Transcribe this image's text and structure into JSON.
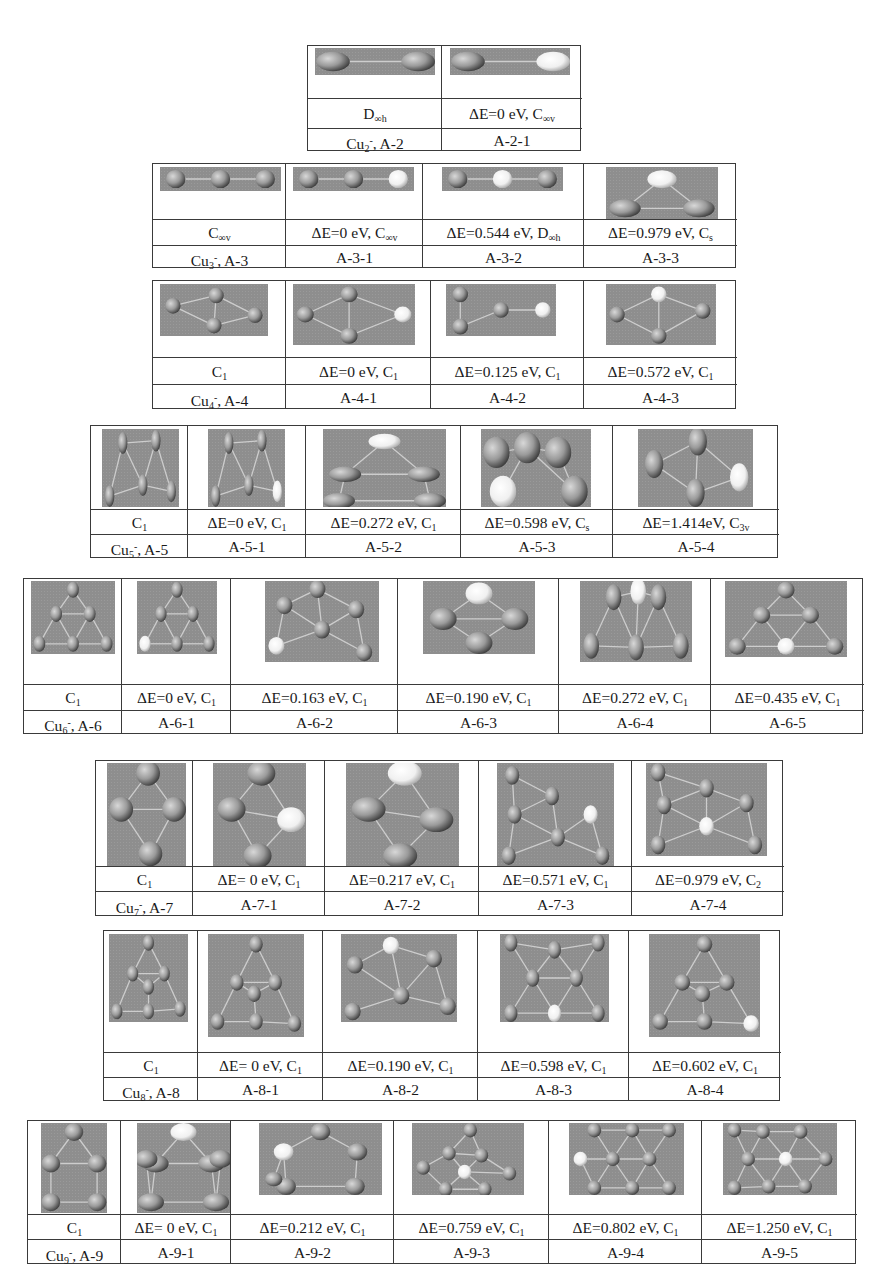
{
  "figure": {
    "tables": [
      {
        "id": "A-2",
        "cells": [
          {
            "sym": "D∞h",
            "sym_main": "D",
            "sym_sub": "∞h",
            "label": "Cu2-, A-2",
            "label_main": "Cu",
            "label_sub": "2",
            "label_sup": "-",
            "label_rest": ", A-2",
            "energy": "",
            "atoms": 2,
            "shape": "dimer-ellipse"
          },
          {
            "sym": "ΔE=0 eV, C∞v",
            "energy_text": "ΔE=0 eV,  C",
            "sym_sub": "∞v",
            "label": "A-2-1",
            "energy": "0",
            "atoms": 2,
            "shape": "dimer-ellipse-light"
          }
        ]
      },
      {
        "id": "A-3",
        "cells": [
          {
            "sym": "C∞v",
            "sym_main": "C",
            "sym_sub": "∞v",
            "label": "Cu3-, A-3",
            "label_main": "Cu",
            "label_sub": "3",
            "label_sup": "-",
            "label_rest": ", A-3",
            "shape": "linear3"
          },
          {
            "sym": "ΔE=0 eV, C∞v",
            "energy_text": "ΔE=0 eV, C",
            "sym_sub": "∞v",
            "label": "A-3-1",
            "energy": "0",
            "shape": "linear3-end-light"
          },
          {
            "sym": "ΔE=0.544 eV, D∞h",
            "energy_text": "ΔE=0.544 eV, D",
            "sym_sub": "∞h",
            "label": "A-3-2",
            "energy": "0.544",
            "shape": "linear3-mid-light"
          },
          {
            "sym": "ΔE=0.979 eV, Cs",
            "energy_text": "ΔE=0.979 eV,  C",
            "sym_sub": "s",
            "label": "A-3-3",
            "energy": "0.979",
            "shape": "triangle"
          }
        ]
      },
      {
        "id": "A-4",
        "cells": [
          {
            "sym": "C1",
            "sym_main": "C",
            "sym_sub": "1",
            "label": "Cu4-, A-4",
            "label_main": "Cu",
            "label_sub": "4",
            "label_sup": "-",
            "label_rest": ", A-4",
            "shape": "rhombus"
          },
          {
            "sym": "ΔE=0 eV, C1",
            "energy_text": "ΔE=0 eV, C",
            "sym_sub": "1",
            "label": "A-4-1",
            "energy": "0",
            "shape": "rhombus-light"
          },
          {
            "sym": "ΔE=0.125 eV, C1",
            "energy_text": "ΔE=0.125 eV, C",
            "sym_sub": "1",
            "label": "A-4-2",
            "energy": "0.125",
            "shape": "chain4"
          },
          {
            "sym": "ΔE=0.572 eV, C1",
            "energy_text": "ΔE=0.572 eV, C",
            "sym_sub": "1",
            "label": "A-4-3",
            "energy": "0.572",
            "shape": "rhombus-top-light"
          }
        ]
      },
      {
        "id": "A-5",
        "cells": [
          {
            "sym": "C1",
            "sym_main": "C",
            "sym_sub": "1",
            "label": "Cu5-, A-5",
            "label_main": "Cu",
            "label_sub": "5",
            "label_sup": "-",
            "label_rest": ", A-5"
          },
          {
            "sym": "ΔE=0 eV, C1",
            "energy_text": "ΔE=0 eV, C",
            "sym_sub": "1",
            "label": "A-5-1",
            "energy": "0"
          },
          {
            "sym": "ΔE=0.272 eV, C1",
            "energy_text": "ΔE=0.272 eV, C",
            "sym_sub": "1",
            "label": "A-5-2",
            "energy": "0.272"
          },
          {
            "sym": "ΔE=0.598 eV, Cs",
            "energy_text": "ΔE=0.598 eV, C",
            "sym_sub": "s",
            "label": "A-5-3",
            "energy": "0.598"
          },
          {
            "sym": "ΔE=1.414eV, C3v",
            "energy_text": "ΔE=1.414eV, C",
            "sym_sub": "3v",
            "label": "A-5-4",
            "energy": "1.414"
          }
        ]
      },
      {
        "id": "A-6",
        "cells": [
          {
            "sym": "C1",
            "sym_main": "C",
            "sym_sub": "1",
            "label": "Cu6-, A-6",
            "label_main": "Cu",
            "label_sub": "6",
            "label_sup": "-",
            "label_rest": ", A-6"
          },
          {
            "sym": "ΔE=0 eV, C1",
            "energy_text": "ΔE=0 eV, C",
            "sym_sub": "1",
            "label": "A-6-1",
            "energy": "0"
          },
          {
            "sym": "ΔE=0.163 eV, C1",
            "energy_text": "ΔE=0.163 eV, C",
            "sym_sub": "1",
            "label": "A-6-2",
            "energy": "0.163"
          },
          {
            "sym": "ΔE=0.190 eV, C1",
            "energy_text": "ΔE=0.190 eV, C",
            "sym_sub": "1",
            "label": "A-6-3",
            "energy": "0.190"
          },
          {
            "sym": "ΔE=0.272 eV, C1",
            "energy_text": "ΔE=0.272 eV, C",
            "sym_sub": "1",
            "label": "A-6-4",
            "energy": "0.272"
          },
          {
            "sym": "ΔE=0.435 eV, C1",
            "energy_text": "ΔE=0.435 eV, C",
            "sym_sub": "1",
            "label": "A-6-5",
            "energy": "0.435"
          }
        ]
      },
      {
        "id": "A-7",
        "cells": [
          {
            "sym": "C1",
            "sym_main": "C",
            "sym_sub": "1",
            "label": "Cu7-, A-7",
            "label_main": "Cu",
            "label_sub": "7",
            "label_sup": "-",
            "label_rest": ", A-7"
          },
          {
            "sym": "ΔE= 0 eV, C1",
            "energy_text": "ΔE= 0 eV, C",
            "sym_sub": "1",
            "label": "A-7-1",
            "energy": "0"
          },
          {
            "sym": "ΔE=0.217 eV, C1",
            "energy_text": "ΔE=0.217 eV, C",
            "sym_sub": "1",
            "label": "A-7-2",
            "energy": "0.217"
          },
          {
            "sym": "ΔE=0.571 eV, C1",
            "energy_text": "ΔE=0.571  eV, C",
            "sym_sub": "1",
            "label": "A-7-3",
            "energy": "0.571"
          },
          {
            "sym": "ΔE=0.979 eV, C2",
            "energy_text": "ΔE=0.979  eV, C",
            "sym_sub": "2",
            "label": "A-7-4",
            "energy": "0.979"
          }
        ]
      },
      {
        "id": "A-8",
        "cells": [
          {
            "sym": "C1",
            "sym_main": "C",
            "sym_sub": "1",
            "label": "Cu8-, A-8",
            "label_main": "Cu",
            "label_sub": "8",
            "label_sup": "-",
            "label_rest": ", A-8"
          },
          {
            "sym": "ΔE= 0 eV, C1",
            "energy_text": "ΔE= 0 eV, C",
            "sym_sub": "1",
            "label": "A-8-1",
            "energy": "0"
          },
          {
            "sym": "ΔE=0.190 eV, C1",
            "energy_text": "ΔE=0.190  eV, C",
            "sym_sub": "1",
            "label": "A-8-2",
            "energy": "0.190"
          },
          {
            "sym": "ΔE=0.598 eV, C1",
            "energy_text": "ΔE=0.598  eV, C",
            "sym_sub": "1",
            "label": "A-8-3",
            "energy": "0.598"
          },
          {
            "sym": "ΔE=0.602 eV, C1",
            "energy_text": "ΔE=0.602  eV, C",
            "sym_sub": "1",
            "label": "A-8-4",
            "energy": "0.602"
          }
        ]
      },
      {
        "id": "A-9",
        "cells": [
          {
            "sym": "C1",
            "sym_main": "C",
            "sym_sub": "1",
            "label": "Cu9-, A-9",
            "label_main": "Cu",
            "label_sub": "9",
            "label_sup": "-",
            "label_rest": ", A-9"
          },
          {
            "sym": "ΔE= 0 eV, C1",
            "energy_text": "ΔE= 0 eV, C",
            "sym_sub": "1",
            "label": "A-9-1",
            "energy": "0"
          },
          {
            "sym": "ΔE=0.212 eV, C1",
            "energy_text": "ΔE=0.212  eV, C",
            "sym_sub": "1",
            "label": "A-9-2",
            "energy": "0.212"
          },
          {
            "sym": "ΔE=0.759 eV, C1",
            "energy_text": "ΔE=0.759  eV, C",
            "sym_sub": "1",
            "label": "A-9-3",
            "energy": "0.759"
          },
          {
            "sym": "ΔE=0.802 eV, C1",
            "energy_text": "ΔE=0.802  eV, C",
            "sym_sub": "1",
            "label": "A-9-4",
            "energy": "0.802"
          },
          {
            "sym": "ΔE=1.250 eV, C1",
            "energy_text": "ΔE=1.250  eV, C",
            "sym_sub": "1",
            "label": "A-9-5",
            "energy": "1.250"
          }
        ]
      }
    ]
  },
  "colors": {
    "panel_bg": "#8e8e8e",
    "atom": "#9a9a9a",
    "atom_highlight": "#f0f0f0",
    "bond": "#d8d8d8",
    "border": "#3a3a3a"
  }
}
